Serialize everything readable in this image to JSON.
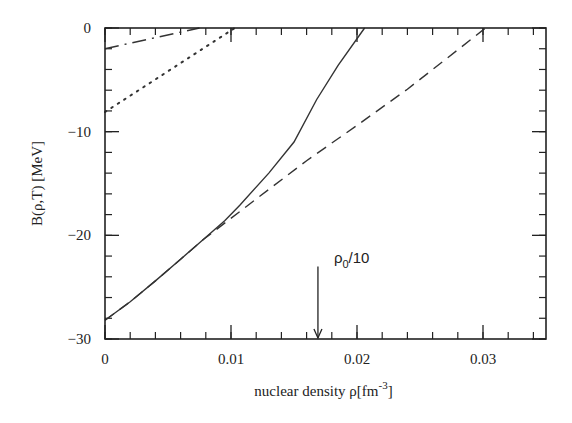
{
  "chart_data": {
    "type": "line",
    "title": "",
    "xlabel": "nuclear density ρ[fm⁻³]",
    "xlabel_parts": {
      "main": "nuclear density ρ[fm",
      "sup": "-3",
      "close": "]"
    },
    "ylabel": "B(ρ,T) [MeV]",
    "xlim": [
      0,
      0.035
    ],
    "ylim": [
      -30,
      0
    ],
    "x_ticks": [
      {
        "value": 0,
        "label": "0"
      },
      {
        "value": 0.01,
        "label": "0.01"
      },
      {
        "value": 0.02,
        "label": "0.02"
      },
      {
        "value": 0.03,
        "label": "0.03"
      }
    ],
    "y_ticks": [
      {
        "value": 0,
        "label": "0"
      },
      {
        "value": -10,
        "label": "−10"
      },
      {
        "value": -20,
        "label": "−20"
      },
      {
        "value": -30,
        "label": "−30"
      }
    ],
    "x_minor_step": 0.002,
    "y_minor_step": 2,
    "grid": false,
    "legend": null,
    "series": [
      {
        "name": "solid",
        "style": "solid",
        "x": [
          0,
          0.002,
          0.004,
          0.006,
          0.0078,
          0.0095,
          0.0107,
          0.013,
          0.015,
          0.0168,
          0.0185,
          0.0206
        ],
        "y": [
          -28.2,
          -26.4,
          -24.4,
          -22.3,
          -20.4,
          -18.6,
          -17.1,
          -14.0,
          -11.0,
          -6.9,
          -3.6,
          0
        ]
      },
      {
        "name": "dashed",
        "style": "dashed",
        "x": [
          0,
          0.002,
          0.004,
          0.006,
          0.0078,
          0.012,
          0.016,
          0.02,
          0.024,
          0.028,
          0.0302
        ],
        "y": [
          -28.2,
          -26.4,
          -24.4,
          -22.3,
          -20.4,
          -16.5,
          -12.8,
          -9.4,
          -5.9,
          -2.1,
          0
        ]
      },
      {
        "name": "dotted",
        "style": "dotted",
        "x": [
          0,
          0.0103
        ],
        "y": [
          -8.1,
          0
        ]
      },
      {
        "name": "dash-dot",
        "style": "dashdot",
        "x": [
          0,
          0.0075
        ],
        "y": [
          -2.0,
          0
        ]
      }
    ],
    "annotations": [
      {
        "text_main": "ρ",
        "text_sub": "0",
        "text_rest": "/10",
        "arrow_x": 0.0169,
        "arrow_y_top": -23.0,
        "arrow_y_bottom": -30
      }
    ]
  }
}
